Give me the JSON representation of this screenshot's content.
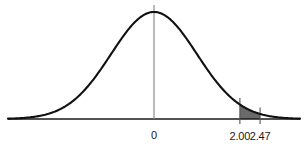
{
  "chart_data": {
    "type": "area",
    "title": "",
    "subtitle": "",
    "xlabel": "",
    "ylabel": "",
    "distribution": "standard normal",
    "mean": 0,
    "std_dev": 1,
    "xlim": [
      -3.4,
      3.4
    ],
    "ylim": [
      0,
      0.42
    ],
    "grid": false,
    "legend": false,
    "curve": {
      "name": "standard normal density",
      "stroke_color": "#111111",
      "stroke_width": 2.1,
      "x": [
        -3.4,
        -3.2,
        -3.0,
        -2.8,
        -2.6,
        -2.4,
        -2.2,
        -2.0,
        -1.8,
        -1.6,
        -1.4,
        -1.2,
        -1.0,
        -0.8,
        -0.6,
        -0.4,
        -0.2,
        0.0,
        0.2,
        0.4,
        0.6,
        0.8,
        1.0,
        1.2,
        1.4,
        1.6,
        1.8,
        2.0,
        2.2,
        2.4,
        2.6,
        2.8,
        3.0,
        3.2,
        3.4
      ],
      "y": [
        0.0012,
        0.0024,
        0.0044,
        0.0079,
        0.0136,
        0.0224,
        0.0355,
        0.054,
        0.079,
        0.1109,
        0.1497,
        0.1942,
        0.242,
        0.2897,
        0.3332,
        0.3683,
        0.391,
        0.3989,
        0.391,
        0.3683,
        0.3332,
        0.2897,
        0.242,
        0.1942,
        0.1497,
        0.1109,
        0.079,
        0.054,
        0.0355,
        0.0224,
        0.0136,
        0.0079,
        0.0044,
        0.0024,
        0.0012
      ]
    },
    "shaded_region": {
      "name": "shaded-area-between-bounds",
      "lower_bound": 2.0,
      "upper_bound": 2.47,
      "fill_color": "#6a6a6a",
      "description": "Area under the normal curve between z = 2.00 and z = 2.47"
    },
    "center_line": {
      "name": "mean-line",
      "x": 0,
      "color": "#8c8c8c"
    },
    "axis": {
      "color": "#1a1a1a",
      "y_position_value": 0
    },
    "ticks": [
      {
        "name": "tick-mean",
        "value": 0,
        "label": "0",
        "has_mark": false
      },
      {
        "name": "tick-lower-bound",
        "value": 2.0,
        "label": "2.00",
        "has_mark": true
      },
      {
        "name": "tick-upper-bound",
        "value": 2.47,
        "label": "2.47",
        "has_mark": true
      }
    ]
  },
  "labels": {
    "zero": "0",
    "lower": "2.00",
    "upper": "2.47"
  },
  "colors": {
    "background": "#ffffff",
    "curve": "#111111",
    "shade": "#6a6a6a",
    "axis": "#1a1a1a",
    "center_line": "#8c8c8c",
    "text": "#1a1a1a"
  }
}
